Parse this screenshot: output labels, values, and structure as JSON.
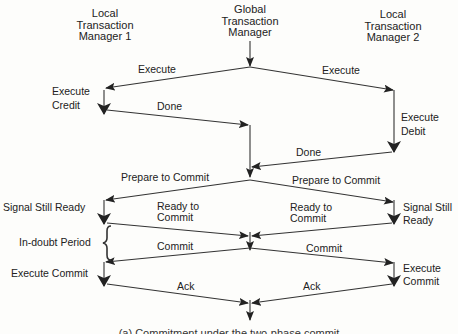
{
  "diagram": {
    "type": "sequence-flow",
    "participants": [
      {
        "id": "ltm1",
        "label_lines": [
          "Local",
          "Transaction",
          "Manager 1"
        ]
      },
      {
        "id": "gtm",
        "label_lines": [
          "Global",
          "Transaction",
          "Manager"
        ]
      },
      {
        "id": "ltm2",
        "label_lines": [
          "Local",
          "Transaction",
          "Manager 2"
        ]
      }
    ],
    "messages": {
      "execute_left": "Execute",
      "execute_right": "Execute",
      "done_left": "Done",
      "done_right": "Done",
      "prepare_left": "Prepare to Commit",
      "prepare_right": "Prepare to Commit",
      "ready_left_1": "Ready to",
      "ready_left_2": "Commit",
      "ready_right_1": "Ready to",
      "ready_right_2": "Commit",
      "commit_left": "Commit",
      "commit_right": "Commit",
      "ack_left": "Ack",
      "ack_right": "Ack"
    },
    "actions": {
      "execute_credit_1": "Execute",
      "execute_credit_2": "Credit",
      "execute_debit_1": "Execute",
      "execute_debit_2": "Debit",
      "signal_ready_left": "Signal Still Ready",
      "signal_ready_right_1": "Signal Still",
      "signal_ready_right_2": "Ready",
      "in_doubt": "In-doubt Period",
      "execute_commit_left": "Execute Commit",
      "execute_commit_right_1": "Execute",
      "execute_commit_right_2": "Commit"
    },
    "caption": "(a) Commitment under the two-phase commit"
  }
}
